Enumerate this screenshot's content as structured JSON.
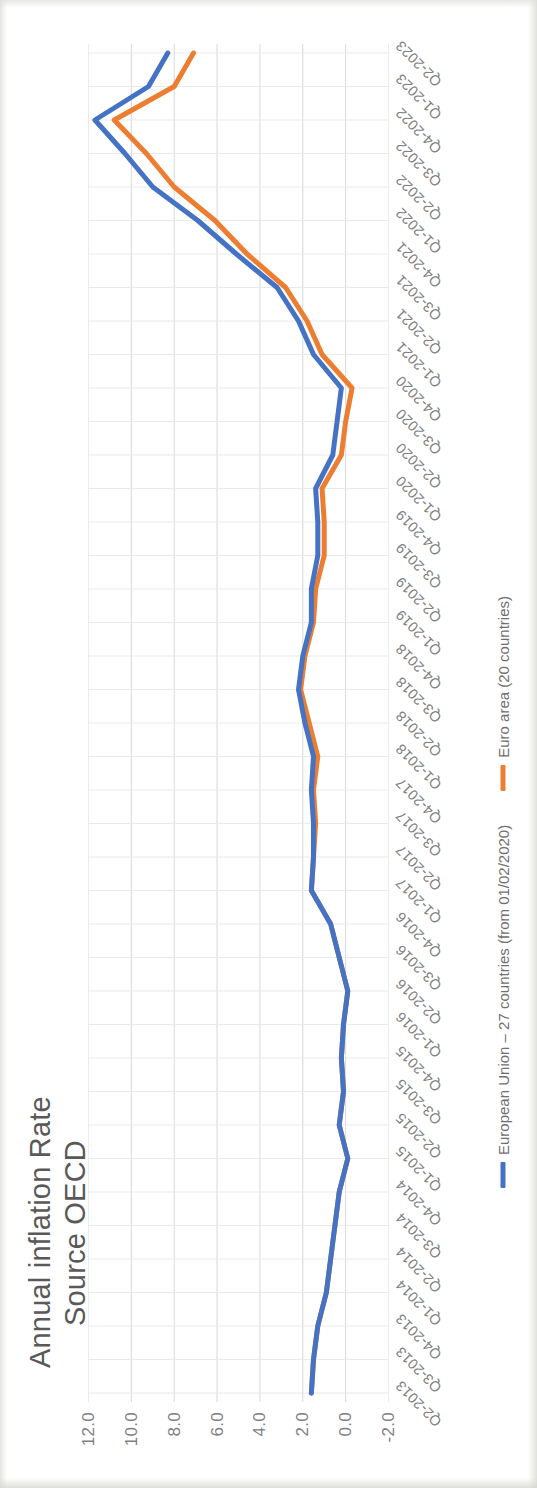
{
  "header": {
    "title": "Annual inflation Rate",
    "subtitle": "Source OECD"
  },
  "legend": {
    "position": "bottom",
    "items": [
      {
        "label": "European Union – 27 countries (from 01/02/2020)",
        "color": "#4472C4",
        "key": "eu27"
      },
      {
        "label": "Euro area (20 countries)",
        "color": "#ED7D31",
        "key": "euro20"
      }
    ]
  },
  "axes": {
    "y": {
      "ticks": [
        "-2.0",
        "0.0",
        "2.0",
        "4.0",
        "6.0",
        "8.0",
        "10.0",
        "12.0"
      ],
      "min": -2.0,
      "max": 12.0,
      "gridlines": true
    },
    "x": {
      "gridlines": true,
      "label_rotation": "-45"
    }
  },
  "chart_data": {
    "type": "line",
    "title": "Annual inflation Rate",
    "subtitle": "Source OECD",
    "xlabel": "",
    "ylabel": "",
    "ylim": [
      -2.0,
      12.0
    ],
    "yticks": [
      -2.0,
      0.0,
      2.0,
      4.0,
      6.0,
      8.0,
      10.0,
      12.0
    ],
    "grid": true,
    "legend_position": "bottom",
    "categories": [
      "Q2-2013",
      "Q3-2013",
      "Q4-2013",
      "Q1-2014",
      "Q2-2014",
      "Q3-2014",
      "Q4-2014",
      "Q1-2015",
      "Q2-2015",
      "Q3-2015",
      "Q4-2015",
      "Q1-2016",
      "Q2-2016",
      "Q3-2016",
      "Q4-2016",
      "Q1-2017",
      "Q2-2017",
      "Q3-2017",
      "Q4-2017",
      "Q1-2018",
      "Q2-2018",
      "Q3-2018",
      "Q4-2018",
      "Q1-2019",
      "Q2-2019",
      "Q3-2019",
      "Q4-2019",
      "Q1-2020",
      "Q2-2020",
      "Q3-2020",
      "Q4-2020",
      "Q1-2021",
      "Q2-2021",
      "Q3-2021",
      "Q4-2021",
      "Q1-2022",
      "Q2-2022",
      "Q3-2022",
      "Q4-2022",
      "Q1-2023",
      "Q2-2023"
    ],
    "series": [
      {
        "name": "Euro area (20 countries)",
        "color": "#ED7D31",
        "values": [
          1.6,
          1.5,
          1.3,
          0.9,
          0.7,
          0.5,
          0.3,
          -0.1,
          0.3,
          0.1,
          0.2,
          0.1,
          -0.1,
          0.3,
          0.7,
          1.6,
          1.5,
          1.4,
          1.5,
          1.3,
          1.7,
          2.1,
          1.9,
          1.5,
          1.4,
          1.0,
          1.0,
          1.1,
          0.2,
          0.0,
          -0.3,
          1.1,
          1.8,
          2.8,
          4.6,
          6.1,
          8.0,
          9.3,
          10.8,
          8.0,
          7.1
        ]
      },
      {
        "name": "European Union – 27 countries (from 01/02/2020)",
        "color": "#4472C4",
        "values": [
          1.6,
          1.5,
          1.3,
          0.9,
          0.7,
          0.5,
          0.3,
          -0.1,
          0.3,
          0.1,
          0.2,
          0.1,
          -0.1,
          0.3,
          0.7,
          1.6,
          1.5,
          1.5,
          1.6,
          1.5,
          1.9,
          2.2,
          2.0,
          1.6,
          1.6,
          1.3,
          1.3,
          1.4,
          0.6,
          0.4,
          0.2,
          1.5,
          2.2,
          3.2,
          5.1,
          6.9,
          9.0,
          10.3,
          11.7,
          9.2,
          8.3
        ]
      }
    ]
  }
}
